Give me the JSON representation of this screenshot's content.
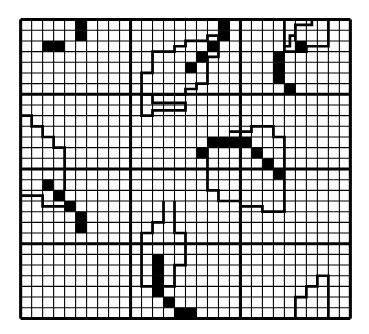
{
  "diagram": {
    "title": "",
    "grid": {
      "cols": 30,
      "rows": 28,
      "major_cols": 3,
      "major_rows": 4,
      "minor_cols_per_major": 10,
      "minor_rows_per_major": 7,
      "line_color": "#000000",
      "background": "#ffffff"
    },
    "filled_cells": [
      [
        5,
        0
      ],
      [
        5,
        1
      ],
      [
        2,
        2
      ],
      [
        3,
        2
      ],
      [
        18,
        0
      ],
      [
        18,
        1
      ],
      [
        17,
        2
      ],
      [
        16,
        3
      ],
      [
        15,
        4
      ],
      [
        25,
        2
      ],
      [
        23,
        3
      ],
      [
        23,
        4
      ],
      [
        23,
        5
      ],
      [
        24,
        6
      ],
      [
        2,
        15
      ],
      [
        3,
        16
      ],
      [
        4,
        17
      ],
      [
        5,
        18
      ],
      [
        5,
        19
      ],
      [
        16,
        12
      ],
      [
        17,
        11
      ],
      [
        18,
        11
      ],
      [
        19,
        11
      ],
      [
        20,
        11
      ],
      [
        21,
        12
      ],
      [
        22,
        13
      ],
      [
        23,
        14
      ],
      [
        12,
        22
      ],
      [
        12,
        23
      ],
      [
        12,
        24
      ],
      [
        12,
        25
      ],
      [
        13,
        26
      ],
      [
        14,
        27
      ],
      [
        15,
        27
      ]
    ],
    "outlines": [
      {
        "name": "top-middle-blob",
        "points": "11,7 11,9 12,9 12,8 15,8 15,7 11,7 M10.8,2 11,2 11,6 14,6 14,5 15,5 15,4 16,4 16,3 18,3 18,2 20,2 20,1 19,1 19,2 17,2 17,1 15,1 15,2 14,2 14,3 13,3 13,4 11,4 11,6"
      }
    ],
    "paths": [
      "M11,8 L11,9 L12,9 L12,8.5 L15,8.5 L15,7.8 L12,7.8 L12,7 L11,7 Z",
      "M11,7 L11,5 L12,5 L12,3 L14,3 L14,2.5 L15,2.5 L15,2 L17,2 L17,1.5 L18,1.5 L18,2.5 L18,3.5 L17,3.5 L17,6 L16,6 L16,6.5 L15,6.5 L15,7 L12,7",
      "M24,0 L24,2.5 L24.5,2.5 L24.5,1.5 L25,1.5 L25,0.5 L26.5,0.5 L26.5,0 M25,1.5 L25,2 M24,2.5 L24,3 L26,3 L26,2.5 L28,2.5 L28,0 L26.5,0",
      "M0,9 L1,9 L1,10 L2,10 L2,11 L3,11 L3,12 L4,12 L4,16",
      "M0,16.5 L2,16.5 L2,17.5 L4,17.5",
      "M17,12 L17,16 L18,16 L18,17 L20,17 L20,17.5 L22,17.5 L22,18 L24,18 L24,11 L23,11 L23,10 L21,10 L21,10.5 L19,10.5",
      "M13,17 L13,19 L12,19 L12,20 L11,20 L11,25 L12,25 M14,17 L14,20 L15,20 L15,23 L14,23 L14,25 L13,25",
      "M25,28 L25,26 L26,26 L26,25 L27,25 L27,24 L28,24 L28,28"
    ]
  }
}
